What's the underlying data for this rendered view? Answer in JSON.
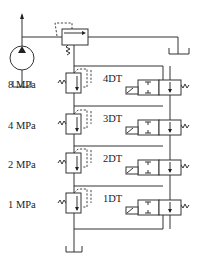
{
  "diagram": {
    "pressure_labels": [
      "8 MPa",
      "4 MPa",
      "2 MPa",
      "1 MPa"
    ],
    "solenoid_labels": [
      "4DT",
      "3DT",
      "2DT",
      "1DT"
    ],
    "components": {
      "pump": "hydraulic-pump",
      "main_relief_valve": "pilot-operated-relief-valve",
      "remote_relief_valves": 4,
      "directional_valves": 4,
      "tanks": 3
    },
    "colors": {
      "line": "#333333",
      "background": "#ffffff"
    }
  }
}
